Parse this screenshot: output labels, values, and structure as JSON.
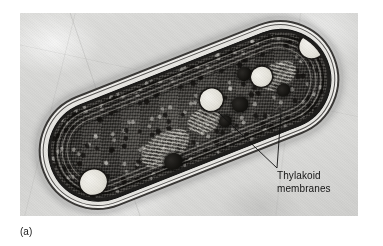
{
  "figure": {
    "type": "electron-micrograph",
    "caption_marker": "(a)",
    "background_color": "#d6d6d4",
    "page_color": "#ffffff"
  },
  "annotations": {
    "thylakoid_label": {
      "line1": "Thylakoid",
      "line2": "membranes",
      "text_color": "#141414",
      "leader_count": 2
    }
  },
  "micrograph": {
    "cell": {
      "shape": "rod",
      "rotation_deg": -21.5,
      "envelope_layers": [
        "sheath",
        "outer-membrane",
        "periplasm",
        "plasma-membrane"
      ],
      "thylakoid_lamellae": 4,
      "inclusions": {
        "light_granules": 4,
        "dark_granules": 5,
        "nucleoid_regions": 3
      }
    }
  }
}
